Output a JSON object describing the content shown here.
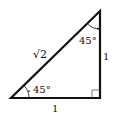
{
  "diagram": {
    "stroke_color": "#111111",
    "background": "#ffffff",
    "vertices": {
      "bottom_left": [
        11,
        98
      ],
      "bottom_right": [
        100,
        98
      ],
      "top": [
        100,
        11
      ]
    },
    "labels": {
      "hypotenuse": "√2",
      "vertical_leg": "1",
      "horizontal_leg": "1",
      "top_angle": "45°",
      "bottom_angle": "45°"
    },
    "right_angle_marker": true
  }
}
